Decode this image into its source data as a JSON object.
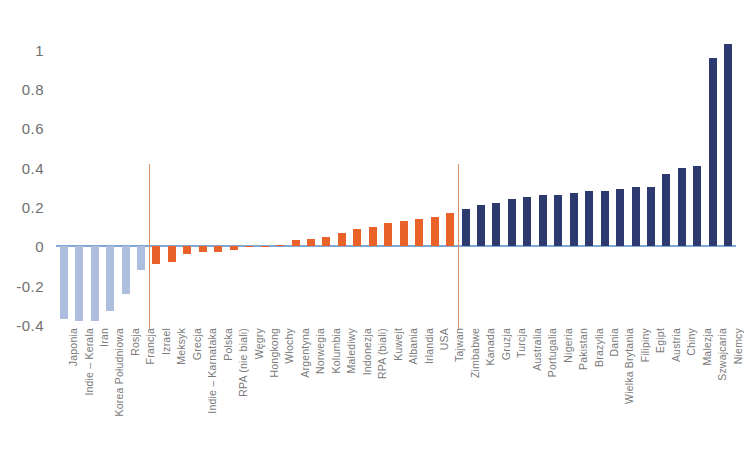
{
  "chart_data": {
    "type": "bar",
    "title": "",
    "subtitle": "",
    "xlabel": "",
    "ylabel": "",
    "ylim": [
      -0.4,
      1.05
    ],
    "yticks": [
      1,
      0.8,
      0.6,
      0.4,
      0.2,
      0,
      -0.2,
      -0.4
    ],
    "ytick_labels": [
      "1",
      "0.8",
      "0.6",
      "0.4",
      "0.2",
      "0",
      "-0.2",
      "-0.4"
    ],
    "grid": false,
    "legend": "none",
    "categories": [
      "Japonia",
      "Indie – Kerala",
      "Iran",
      "Korea Południowa",
      "Rosja",
      "Francja",
      "Izrael",
      "Meksyk",
      "Grecja",
      "Indie – Karnataka",
      "Polska",
      "RPA (nie biali)",
      "Węgry",
      "Hongkong",
      "Włochy",
      "Argentyna",
      "Norwegia",
      "Kolumbia",
      "Malediwy",
      "Indonezja",
      "RPA (biali)",
      "Kuwejt",
      "Albania",
      "Irlandia",
      "USA",
      "Tajwan",
      "Zimbabwe",
      "Kanada",
      "Gruzja",
      "Turcja",
      "Australia",
      "Portugalia",
      "Nigeria",
      "Pakistan",
      "Brazylia",
      "Dania",
      "Wielka Brytania",
      "Filipiny",
      "Egipt",
      "Austria",
      "Chiny",
      "Malezja",
      "Szwajcaria",
      "Niemcy"
    ],
    "values": [
      -0.37,
      -0.38,
      -0.38,
      -0.33,
      -0.24,
      -0.12,
      -0.09,
      -0.08,
      -0.04,
      -0.03,
      -0.03,
      -0.02,
      -0.005,
      0.0,
      0.005,
      0.03,
      0.04,
      0.05,
      0.07,
      0.09,
      0.1,
      0.12,
      0.13,
      0.14,
      0.15,
      0.17,
      0.19,
      0.21,
      0.22,
      0.24,
      0.25,
      0.26,
      0.26,
      0.27,
      0.28,
      0.28,
      0.29,
      0.3,
      0.3,
      0.37,
      0.4,
      0.41,
      0.96,
      1.03
    ],
    "colors": [
      "#aebede",
      "#aebede",
      "#aebede",
      "#aebede",
      "#aebede",
      "#aebede",
      "#e8622a",
      "#e8622a",
      "#e8622a",
      "#e8622a",
      "#e8622a",
      "#e8622a",
      "#e8622a",
      "#e8622a",
      "#e8622a",
      "#e8622a",
      "#e8622a",
      "#e8622a",
      "#e8622a",
      "#e8622a",
      "#e8622a",
      "#e8622a",
      "#e8622a",
      "#e8622a",
      "#e8622a",
      "#e8622a",
      "#2d3a70",
      "#2d3a70",
      "#2d3a70",
      "#2d3a70",
      "#2d3a70",
      "#2d3a70",
      "#2d3a70",
      "#2d3a70",
      "#2d3a70",
      "#2d3a70",
      "#2d3a70",
      "#2d3a70",
      "#2d3a70",
      "#2d3a70",
      "#2d3a70",
      "#2d3a70",
      "#2d3a70",
      "#2d3a70"
    ],
    "separators": [
      {
        "after_category": "Francja",
        "index": 6,
        "color": "#d98f63"
      },
      {
        "after_category": "Tajwan",
        "index": 26,
        "color": "#d98f63"
      }
    ],
    "palette": {
      "negative_blue": "#aebede",
      "orange": "#e8622a",
      "navy": "#2d3a70",
      "zero_axis": "#7fa8d4",
      "separator": "#d98f63",
      "tick_text": "#6f6f6f",
      "category_text": "#7a7a7a",
      "background": "#ffffff"
    }
  }
}
